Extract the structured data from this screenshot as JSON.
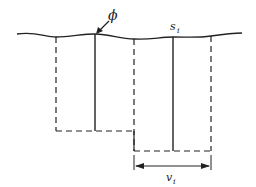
{
  "diagram": {
    "labels": {
      "phi": "ϕ",
      "s_main": "s",
      "s_sub": "i",
      "v_main": "v",
      "v_sub": "i"
    },
    "colors": {
      "stroke": "#222222",
      "background": "#ffffff"
    },
    "elements": {
      "surface": "wavy-surface-line",
      "solid_verticals": 2,
      "dashed_verticals": 3,
      "dimension": "width-arrow-v_i"
    }
  }
}
